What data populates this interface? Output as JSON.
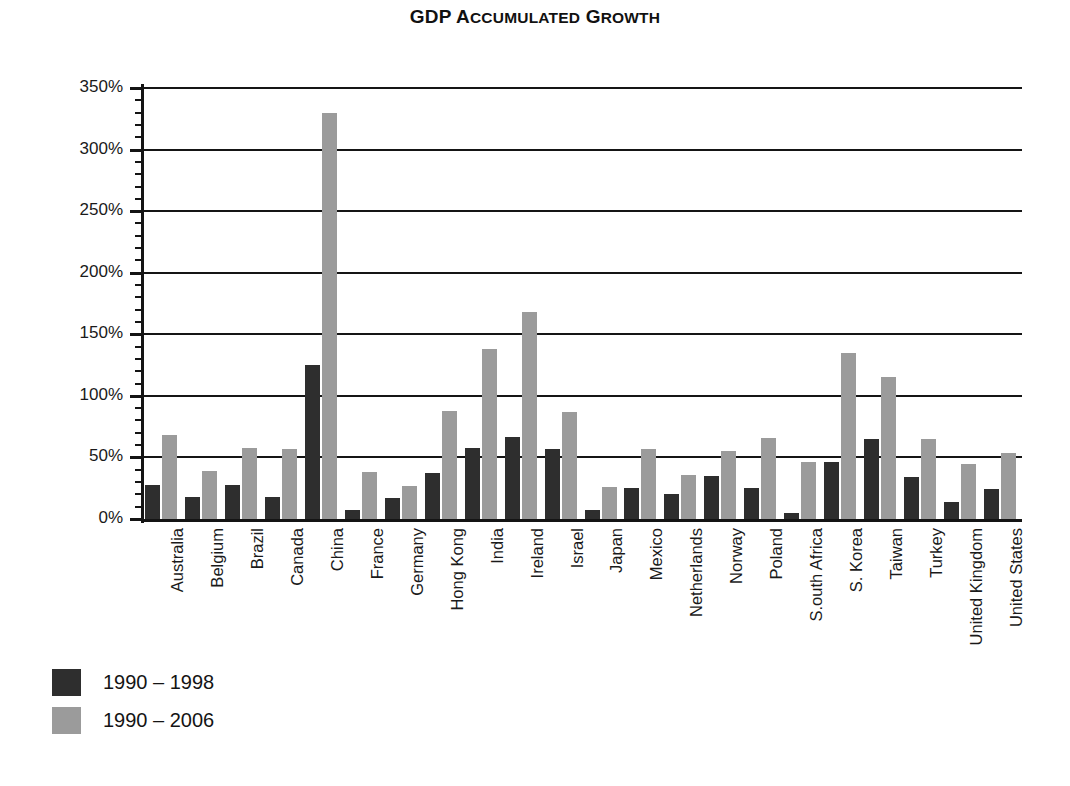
{
  "chart_data": {
    "type": "bar",
    "title": "GDP Accumulated Growth",
    "title_first_word": "GDP ",
    "xlabel": "",
    "ylabel": "",
    "ylim": [
      0,
      350
    ],
    "ytick_step": 50,
    "yminor_step": 10,
    "grid": true,
    "legend_position": "bottom-left",
    "value_suffix": "%",
    "categories": [
      "Australia",
      "Belgium",
      "Brazil",
      "Canada",
      "China",
      "France",
      "Germany",
      "Hong Kong",
      "India",
      "Ireland",
      "Israel",
      "Japan",
      "Mexico",
      "Netherlands",
      "Norway",
      "Poland",
      "S.outh Africa",
      "S. Korea",
      "Taiwan",
      "Turkey",
      "United Kingdom",
      "United States"
    ],
    "yticks": [
      "0%",
      "50%",
      "100%",
      "150%",
      "200%",
      "250%",
      "300%",
      "350%"
    ],
    "series": [
      {
        "name": "1990 – 1998",
        "color": "#2e2e2e",
        "values": [
          28,
          18,
          28,
          18,
          125,
          7,
          17,
          37,
          58,
          67,
          57,
          7,
          25,
          20,
          35,
          25,
          5,
          46,
          65,
          34,
          14,
          24
        ]
      },
      {
        "name": "1990 – 2006",
        "color": "#9b9b9b",
        "values": [
          68,
          39,
          58,
          57,
          330,
          38,
          27,
          88,
          138,
          168,
          87,
          26,
          57,
          36,
          55,
          66,
          46,
          135,
          115,
          65,
          45,
          54
        ]
      }
    ]
  }
}
